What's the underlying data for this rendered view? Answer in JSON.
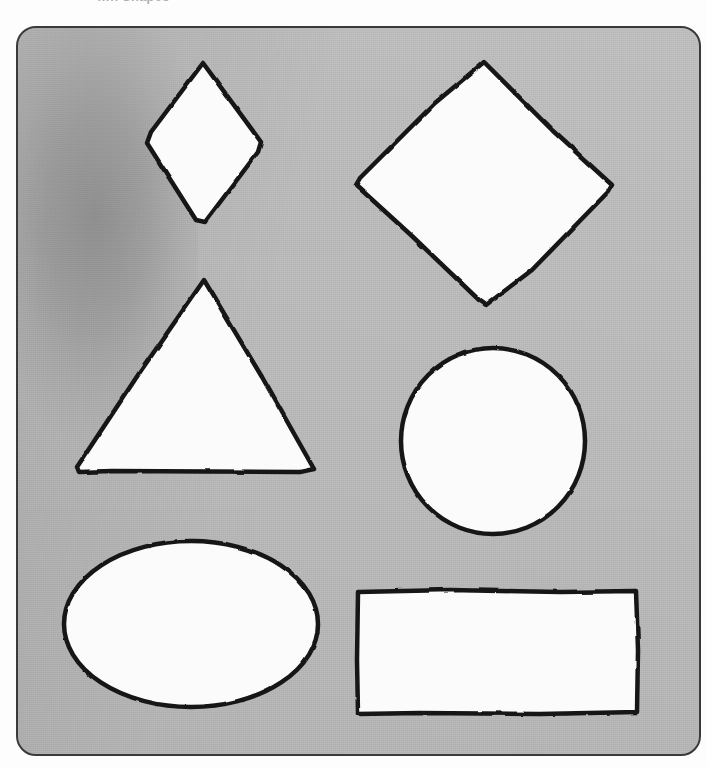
{
  "page": {
    "clipped_header_text": "…h Shapes",
    "card_color": "#bcbcbc",
    "shape_fill_color": "#fbfbfb",
    "shape_outline_color": "#161616",
    "background_color": "#fdfdfd"
  },
  "shapes": [
    {
      "id": "rhombus",
      "name": "rhombus",
      "label": "Rhombus",
      "row": 1,
      "column": 1,
      "fill": "#fbfbfb",
      "outline": "#161616",
      "bounds": {
        "x": 145,
        "y": 62,
        "width": 117,
        "height": 162
      },
      "points": "203,63 261,142 258,152 205,222 196,220 147,143 151,132"
    },
    {
      "id": "diamond",
      "name": "diamond",
      "label": "Diamond",
      "row": 1,
      "column": 2,
      "fill": "#fbfbfb",
      "outline": "#161616",
      "bounds": {
        "x": 354,
        "y": 61,
        "width": 260,
        "height": 245
      },
      "points": "484,62 553,131 612,185 608,192 532,270 486,305 479,300 412,236 356,185 360,178 435,103"
    },
    {
      "id": "triangle",
      "name": "triangle",
      "label": "Triangle",
      "row": 2,
      "column": 1,
      "fill": "#fbfbfb",
      "outline": "#161616",
      "bounds": {
        "x": 76,
        "y": 279,
        "width": 240,
        "height": 195
      },
      "points": "204,280 262,377 314,469 300,472 112,471 79,472 77,467 140,372"
    },
    {
      "id": "circle",
      "name": "circle",
      "label": "Circle",
      "row": 2,
      "column": 2,
      "fill": "#fbfbfb",
      "outline": "#161616",
      "bounds": {
        "x": 400,
        "y": 347,
        "width": 186,
        "height": 187
      },
      "center": {
        "cx": 493,
        "cy": 441
      },
      "radius": {
        "rx": 92,
        "ry": 93
      }
    },
    {
      "id": "ellipse",
      "name": "ellipse",
      "label": "Ellipse",
      "row": 3,
      "column": 1,
      "fill": "#fbfbfb",
      "outline": "#161616",
      "bounds": {
        "x": 63,
        "y": 540,
        "width": 256,
        "height": 168
      },
      "center": {
        "cx": 191,
        "cy": 624
      },
      "radius": {
        "rx": 127,
        "ry": 83
      }
    },
    {
      "id": "rectangle",
      "name": "rectangle",
      "label": "Rectangle",
      "row": 3,
      "column": 2,
      "fill": "#fbfbfb",
      "outline": "#161616",
      "bounds": {
        "x": 357,
        "y": 590,
        "width": 281,
        "height": 125
      },
      "points": "358,592 450,590 560,592 636,591 638,650 637,712 540,714 420,713 358,714 357,660"
    }
  ]
}
